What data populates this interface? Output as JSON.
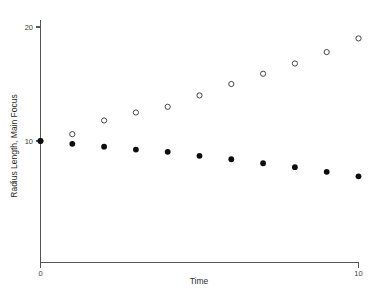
{
  "chart_data": {
    "type": "scatter",
    "title": "",
    "xlabel": "Time",
    "ylabel": "Radius Length, Main Focus",
    "xlim": [
      0,
      10
    ],
    "ylim": [
      0,
      21.2
    ],
    "grid": false,
    "legend": "none",
    "x_ticks": [
      {
        "value": 0,
        "label": "0"
      },
      {
        "value": 10,
        "label": "10"
      }
    ],
    "y_ticks": [
      {
        "value": 10,
        "label": "10"
      },
      {
        "value": 20,
        "label": "20"
      }
    ],
    "x": [
      0,
      1,
      2,
      3,
      4,
      5,
      6,
      7,
      8,
      9,
      10
    ],
    "series": [
      {
        "name": "open-circles-increasing",
        "marker": "open-circle",
        "color": "#3d3d3d",
        "values": [
          10.0,
          10.6,
          11.8,
          12.5,
          13.0,
          14.0,
          15.0,
          15.9,
          16.8,
          17.8,
          19.0
        ]
      },
      {
        "name": "filled-circles-decreasing",
        "marker": "filled-circle",
        "color": "#0d0d0d",
        "values": [
          10.0,
          9.75,
          9.5,
          9.25,
          9.05,
          8.7,
          8.4,
          8.05,
          7.7,
          7.3,
          6.9
        ]
      }
    ]
  },
  "axes": {
    "x_axis_title": "Time",
    "y_axis_title": "Radius Length, Main Focus"
  }
}
